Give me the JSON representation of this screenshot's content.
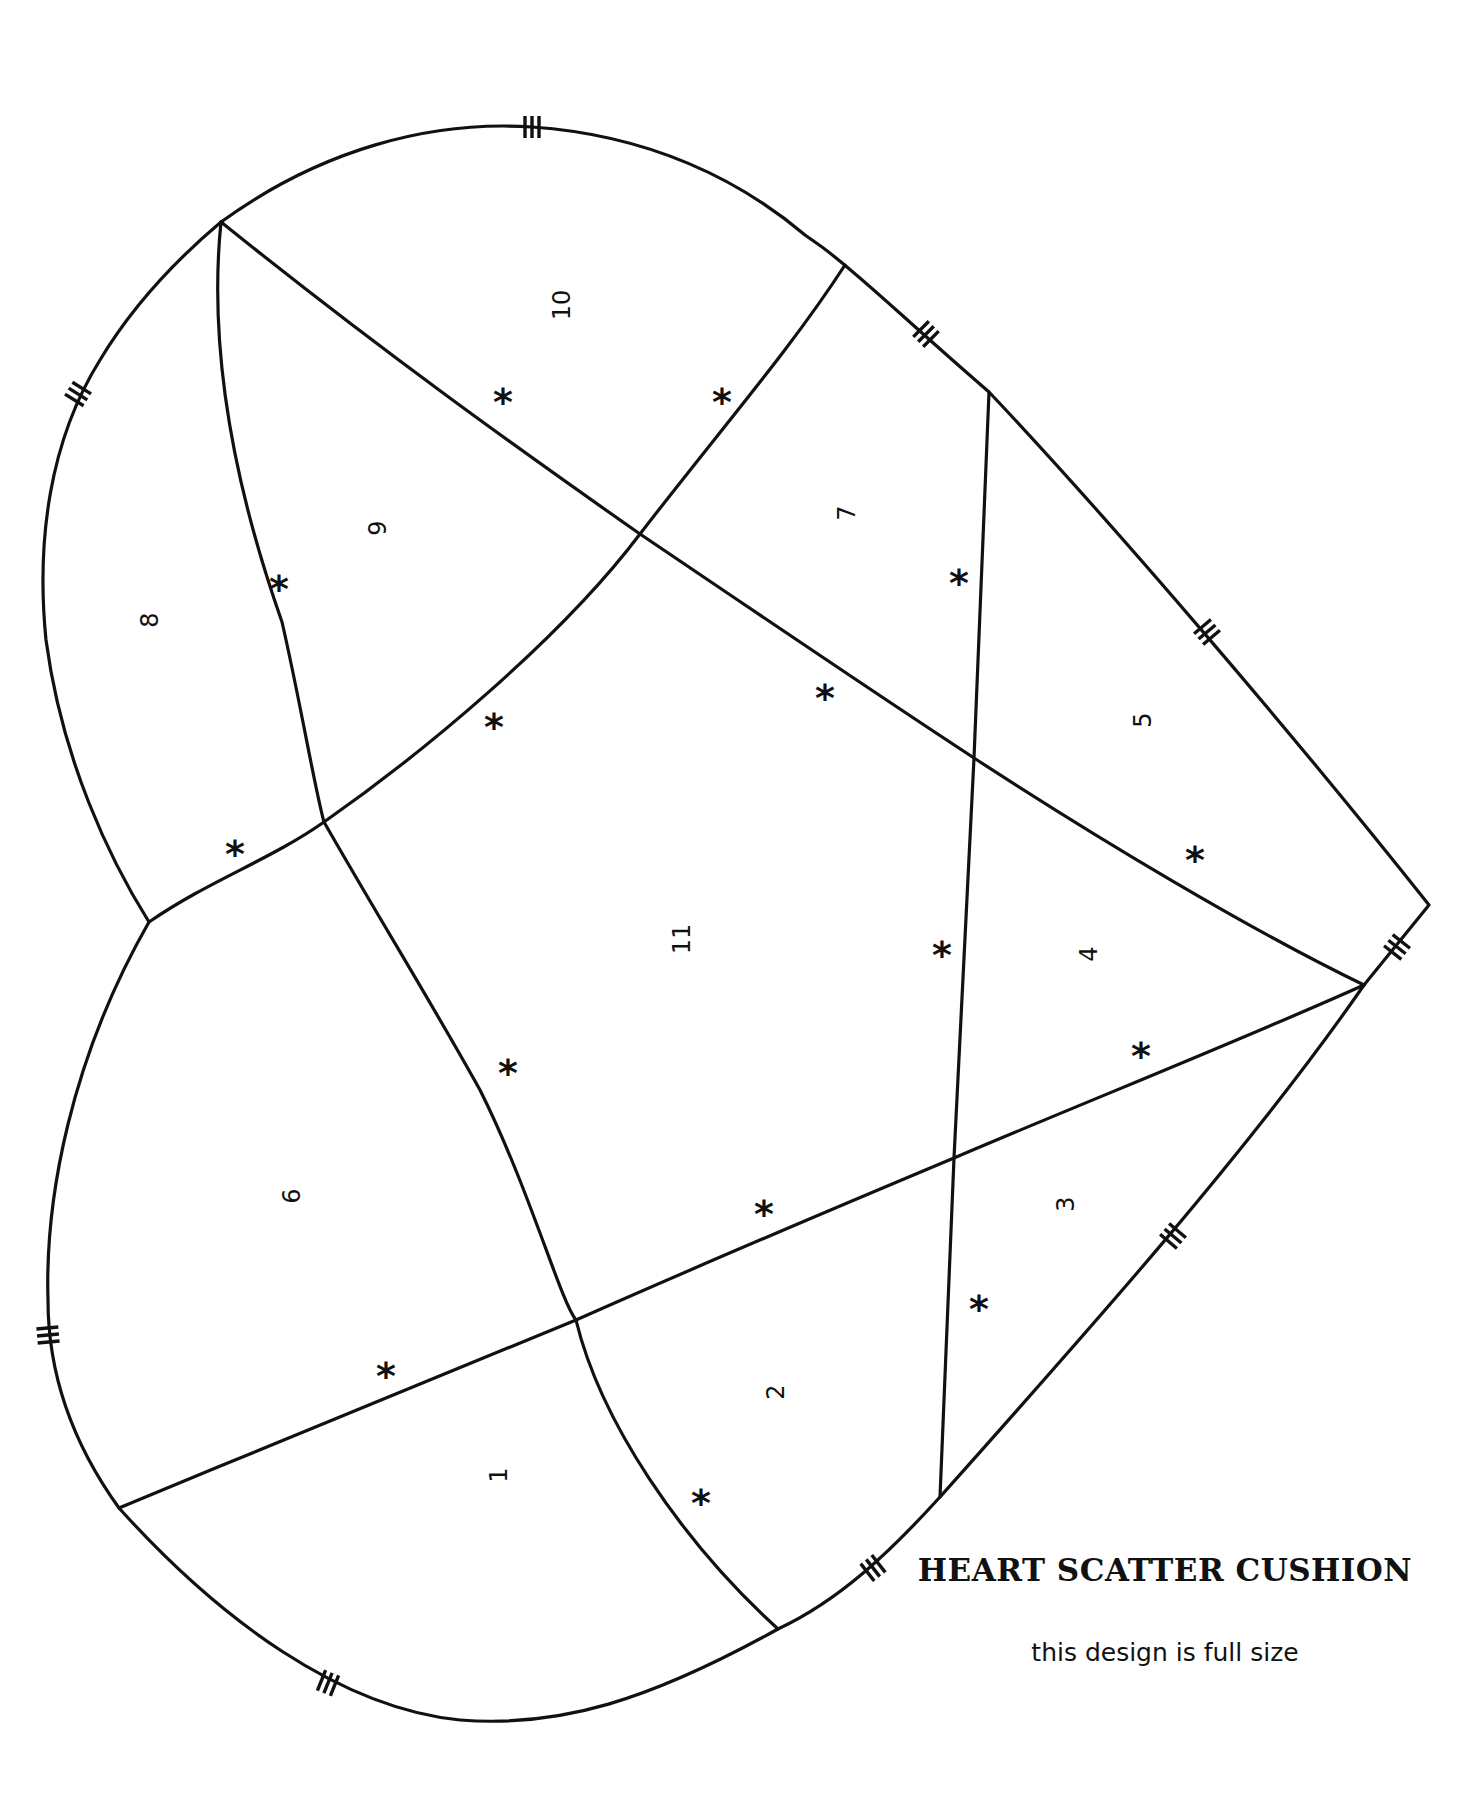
{
  "title": "HEART SCATTER CUSHION",
  "subtitle": "this design is full size",
  "colors": {
    "line": "#111111",
    "background": "#ffffff"
  },
  "pieces": [
    {
      "label": "1",
      "x": 499,
      "y": 1475
    },
    {
      "label": "2",
      "x": 776,
      "y": 1392
    },
    {
      "label": "3",
      "x": 1066,
      "y": 1204
    },
    {
      "label": "4",
      "x": 1089,
      "y": 954
    },
    {
      "label": "5",
      "x": 1143,
      "y": 720
    },
    {
      "label": "6",
      "x": 292,
      "y": 1196
    },
    {
      "label": "7",
      "x": 847,
      "y": 513
    },
    {
      "label": "8",
      "x": 150,
      "y": 620
    },
    {
      "label": "9",
      "x": 378,
      "y": 528
    },
    {
      "label": "10",
      "x": 562,
      "y": 305
    },
    {
      "label": "11",
      "x": 682,
      "y": 939
    }
  ],
  "seam_marks": {
    "symbol": "*",
    "positions": [
      [
        503,
        401
      ],
      [
        722,
        401
      ],
      [
        279,
        588
      ],
      [
        959,
        582
      ],
      [
        494,
        726
      ],
      [
        825,
        697
      ],
      [
        235,
        853
      ],
      [
        1195,
        859
      ],
      [
        942,
        954
      ],
      [
        508,
        1072
      ],
      [
        1141,
        1055
      ],
      [
        764,
        1213
      ],
      [
        386,
        1375
      ],
      [
        979,
        1308
      ],
      [
        701,
        1502
      ]
    ]
  },
  "alignment_ticks": {
    "symbol": "triple-hash",
    "positions": [
      {
        "x": 532,
        "y": 127,
        "angle": 0
      },
      {
        "x": 78,
        "y": 394,
        "angle": -58
      },
      {
        "x": 926,
        "y": 334,
        "angle": 45
      },
      {
        "x": 1207,
        "y": 632,
        "angle": 50
      },
      {
        "x": 1397,
        "y": 947,
        "angle": -52
      },
      {
        "x": 1173,
        "y": 1236,
        "angle": -50
      },
      {
        "x": 873,
        "y": 1568,
        "angle": -38
      },
      {
        "x": 328,
        "y": 1683,
        "angle": 22
      },
      {
        "x": 48,
        "y": 1335,
        "angle": 85
      }
    ]
  }
}
